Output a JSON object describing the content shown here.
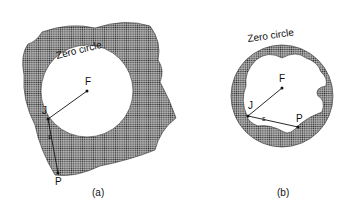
{
  "figure_a": {
    "caption": "(a)",
    "zero_circle_label": "Zero circle",
    "point_F": "F",
    "point_J": "J",
    "point_P": "P",
    "segment_label": "s"
  },
  "figure_b": {
    "caption": "(b)",
    "zero_circle_label": "Zero circle",
    "point_F": "F",
    "point_J": "J",
    "point_P": "P",
    "segment_label": "s"
  },
  "colors": {
    "stipple": "#2a2a2a",
    "line": "#111111",
    "background": "#ffffff"
  }
}
